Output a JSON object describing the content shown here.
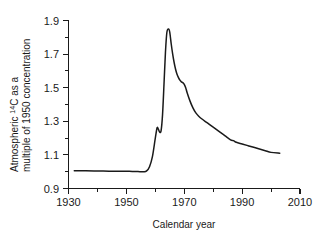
{
  "chart_data": {
    "type": "line",
    "title": "",
    "xlabel": "Calendar year",
    "ylabel_line1": "Atmospheric ",
    "ylabel_sup": "14",
    "ylabel_line1b": "C as a",
    "ylabel_line2": "multiple of 1950 concentration",
    "ylabel_full": "Atmospheric 14C as a multiple of 1950 concentration",
    "xlim": [
      1930,
      2010
    ],
    "ylim": [
      0.9,
      1.9
    ],
    "x_major_ticks": [
      1930,
      1950,
      1970,
      1990,
      2010
    ],
    "x_major_tick_labels": [
      "1930",
      "1950",
      "1970",
      "1990",
      "2010"
    ],
    "x_minor_ticks": [
      1940,
      1960,
      1980,
      2000
    ],
    "y_major_ticks": [
      0.9,
      1.1,
      1.3,
      1.5,
      1.7,
      1.9
    ],
    "y_major_tick_labels": [
      "0.9",
      "1.1",
      "1.3",
      "1.5",
      "1.7",
      "1.9"
    ],
    "y_minor_ticks": [
      1.0,
      1.2,
      1.4,
      1.6,
      1.8
    ],
    "grid": false,
    "legend": null,
    "line_color": "#1a1a1a",
    "background_color": "#ffffff",
    "series": [
      {
        "name": "Atmospheric radiocarbon (bomb curve)",
        "x": [
          1932,
          1936,
          1940,
          1944,
          1948,
          1951,
          1954,
          1955,
          1956,
          1957,
          1958,
          1959,
          1960,
          1960.6,
          1961,
          1961.5,
          1962,
          1962.5,
          1963,
          1963.5,
          1964,
          1964.6,
          1965,
          1965.5,
          1966,
          1966.5,
          1967,
          1967.5,
          1968,
          1968.5,
          1969,
          1969.5,
          1970,
          1970.5,
          1971,
          1972,
          1973,
          1974,
          1975,
          1976,
          1978,
          1980,
          1982,
          1984,
          1986,
          1987,
          1988,
          1990,
          1992,
          1994,
          1996,
          1998,
          2000,
          2003
        ],
        "y": [
          1.005,
          1.005,
          1.004,
          1.003,
          1.002,
          1.002,
          1.001,
          1.0,
          1.0,
          1.005,
          1.03,
          1.09,
          1.2,
          1.26,
          1.255,
          1.235,
          1.245,
          1.34,
          1.52,
          1.71,
          1.83,
          1.85,
          1.83,
          1.76,
          1.7,
          1.65,
          1.61,
          1.58,
          1.56,
          1.545,
          1.535,
          1.53,
          1.52,
          1.5,
          1.47,
          1.42,
          1.38,
          1.35,
          1.33,
          1.315,
          1.29,
          1.265,
          1.24,
          1.215,
          1.19,
          1.185,
          1.175,
          1.165,
          1.155,
          1.145,
          1.135,
          1.125,
          1.115,
          1.11
        ]
      }
    ]
  }
}
